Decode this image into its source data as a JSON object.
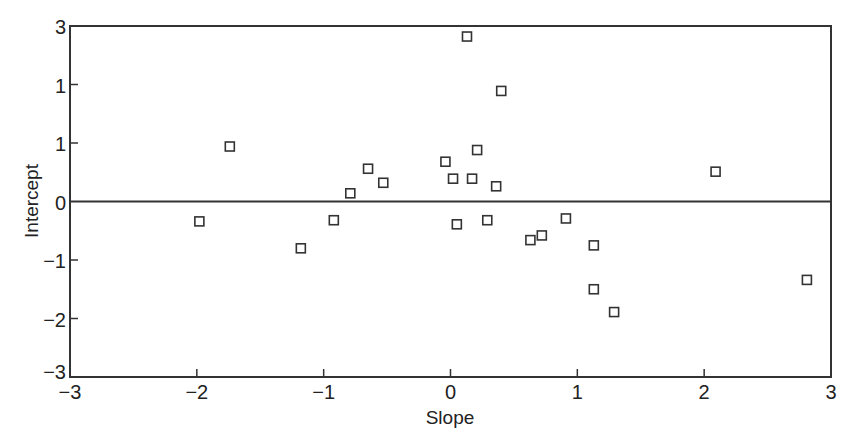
{
  "chart_data": {
    "type": "scatter",
    "title": "",
    "xlabel": "Slope",
    "ylabel": "Intercept",
    "xlim": [
      -3,
      3
    ],
    "ylim": [
      -3,
      3
    ],
    "grid": false,
    "legend": null,
    "marker": "open-square",
    "reference_line": {
      "y": 0
    },
    "x_ticks": [
      {
        "value": -3,
        "label": "−3"
      },
      {
        "value": -2,
        "label": "−2"
      },
      {
        "value": -1,
        "label": "−1"
      },
      {
        "value": 0,
        "label": "0"
      },
      {
        "value": 1,
        "label": "1"
      },
      {
        "value": 2,
        "label": "2"
      },
      {
        "value": 3,
        "label": "3"
      }
    ],
    "y_ticks": [
      {
        "value": 3,
        "label": "3"
      },
      {
        "value": 2,
        "label": "1"
      },
      {
        "value": 1,
        "label": "1"
      },
      {
        "value": 0,
        "label": "0"
      },
      {
        "value": -1,
        "label": "−1"
      },
      {
        "value": -2,
        "label": "−2"
      },
      {
        "value": -3,
        "label": "−3"
      }
    ],
    "points": [
      {
        "x": -1.98,
        "y": -0.34
      },
      {
        "x": -1.74,
        "y": 0.94
      },
      {
        "x": -1.18,
        "y": -0.8
      },
      {
        "x": -0.92,
        "y": -0.32
      },
      {
        "x": -0.79,
        "y": 0.14
      },
      {
        "x": -0.65,
        "y": 0.56
      },
      {
        "x": -0.53,
        "y": 0.32
      },
      {
        "x": -0.04,
        "y": 0.68
      },
      {
        "x": 0.02,
        "y": 0.39
      },
      {
        "x": 0.05,
        "y": -0.39
      },
      {
        "x": 0.13,
        "y": 2.82
      },
      {
        "x": 0.17,
        "y": 0.39
      },
      {
        "x": 0.21,
        "y": 0.88
      },
      {
        "x": 0.29,
        "y": -0.32
      },
      {
        "x": 0.36,
        "y": 0.26
      },
      {
        "x": 0.4,
        "y": 1.89
      },
      {
        "x": 0.63,
        "y": -0.66
      },
      {
        "x": 0.72,
        "y": -0.58
      },
      {
        "x": 0.91,
        "y": -0.29
      },
      {
        "x": 1.13,
        "y": -0.75
      },
      {
        "x": 1.13,
        "y": -1.5
      },
      {
        "x": 1.29,
        "y": -1.89
      },
      {
        "x": 2.09,
        "y": 0.51
      },
      {
        "x": 2.81,
        "y": -1.34
      }
    ]
  },
  "colors": {
    "axis": "#333333",
    "marker_stroke": "#333333",
    "background": "#ffffff"
  }
}
